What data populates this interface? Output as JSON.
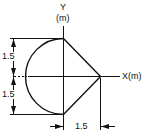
{
  "diagram": {
    "type": "engineering-section",
    "axes": {
      "y_label": "Y",
      "y_unit": "(m)",
      "x_label": "X(m)"
    },
    "dimensions": {
      "upper_vertical": "1.5",
      "lower_vertical": "1.5",
      "horizontal": "1.5"
    },
    "colors": {
      "line": "#111111",
      "background": "#ffffff"
    }
  }
}
